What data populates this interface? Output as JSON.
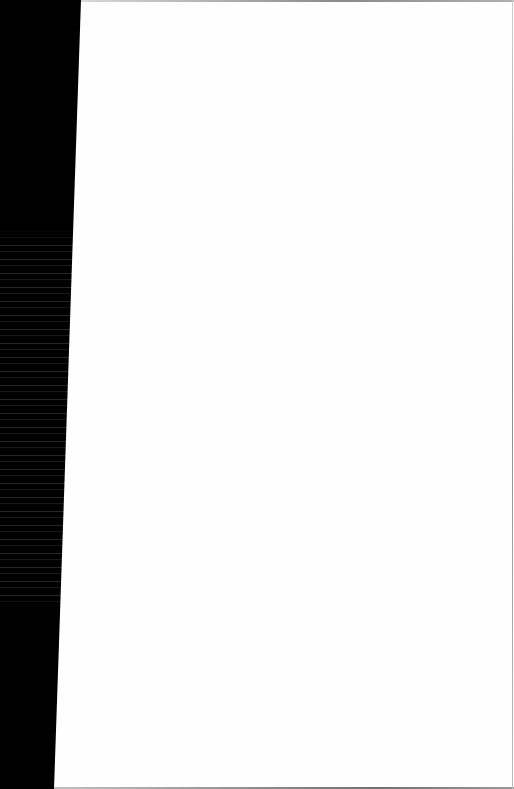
{
  "page": {
    "content_text": "",
    "colors": {
      "paper": "#fefefe",
      "background": "#000000",
      "edge": "#8a8a8a"
    }
  }
}
